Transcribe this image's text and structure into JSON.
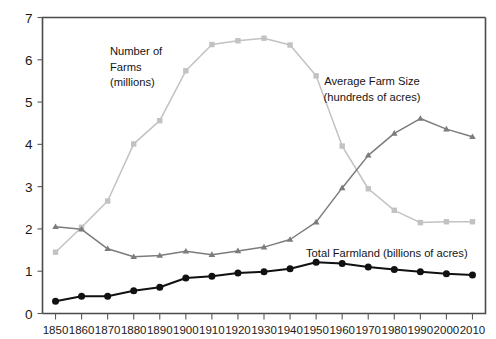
{
  "chart_data": {
    "type": "line",
    "title": "",
    "xlabel": "",
    "ylabel": "",
    "xlim": [
      1845,
      2015
    ],
    "ylim": [
      0,
      7
    ],
    "grid": false,
    "legend": "inline-annotations",
    "x": [
      1850,
      1860,
      1870,
      1880,
      1890,
      1900,
      1910,
      1920,
      1930,
      1940,
      1950,
      1960,
      1970,
      1980,
      1990,
      2000,
      2010
    ],
    "categories": [
      "1850",
      "1860",
      "1870",
      "1880",
      "1890",
      "1900",
      "1910",
      "1920",
      "1930",
      "1940",
      "1950",
      "1960",
      "1970",
      "1980",
      "1990",
      "2000",
      "2010"
    ],
    "yticks": [
      0,
      1,
      2,
      3,
      4,
      5,
      6,
      7
    ],
    "ytick_labels": [
      "0",
      "1",
      "2",
      "3",
      "4",
      "5",
      "6",
      "7"
    ],
    "series": [
      {
        "name": "Number of Farms (millions)",
        "marker": "square",
        "color": "#c2c2c2",
        "values": [
          1.45,
          2.04,
          2.66,
          4.01,
          4.56,
          5.74,
          6.36,
          6.45,
          6.51,
          6.35,
          5.62,
          3.96,
          2.95,
          2.44,
          2.15,
          2.17,
          2.17
        ]
      },
      {
        "name": "Average Farm Size (hundreds of acres)",
        "marker": "triangle",
        "color": "#7c7c7c",
        "values": [
          2.05,
          1.99,
          1.53,
          1.34,
          1.37,
          1.47,
          1.39,
          1.48,
          1.57,
          1.75,
          2.16,
          2.97,
          3.74,
          4.26,
          4.61,
          4.36,
          4.18
        ]
      },
      {
        "name": "Total Farmland (billions of acres)",
        "marker": "circle",
        "color": "#111111",
        "values": [
          0.29,
          0.41,
          0.41,
          0.54,
          0.62,
          0.84,
          0.88,
          0.96,
          0.99,
          1.06,
          1.21,
          1.18,
          1.1,
          1.04,
          0.99,
          0.94,
          0.91
        ]
      }
    ],
    "annotations": [
      {
        "id": "farms",
        "lines": [
          "Number of",
          "Farms",
          "(millions)"
        ],
        "x": 110,
        "y": 55
      },
      {
        "id": "farm-size",
        "lines": [
          "Average Farm Size",
          "(hundreds of acres)"
        ],
        "x": 372,
        "y": 85
      },
      {
        "id": "farmland",
        "lines": [
          "Total Farmland (billions of acres)"
        ],
        "x": 306,
        "y": 257
      }
    ]
  }
}
